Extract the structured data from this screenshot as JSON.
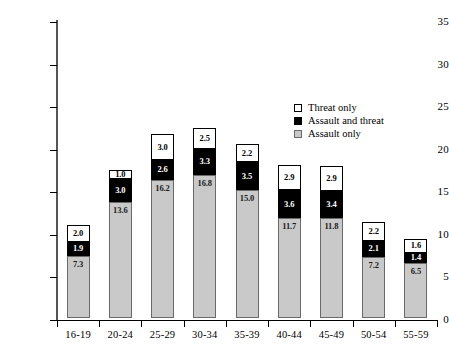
{
  "chart_data": {
    "type": "bar",
    "subtype": "stacked-bar",
    "title": "",
    "xlabel": "",
    "ylabel": "% of men",
    "ylim": [
      0,
      35
    ],
    "ytick_step": 5,
    "yticks": [
      "35",
      "30",
      "25",
      "20",
      "15",
      "10",
      "5",
      "0"
    ],
    "grid": false,
    "legend_position": "upper-right",
    "categories": [
      "16-19",
      "20-24",
      "25-29",
      "30-34",
      "35-39",
      "40-44",
      "45-49",
      "50-54",
      "55-59"
    ],
    "series": [
      {
        "name": "Assault only",
        "color": "#c9c9c9",
        "values": [
          7.3,
          13.6,
          16.2,
          16.8,
          15.0,
          11.7,
          11.8,
          7.2,
          6.5
        ],
        "labels": [
          "7.3",
          "13.6",
          "16.2",
          "16.8",
          "15.0",
          "11.7",
          "11.8",
          "7.2",
          "6.5"
        ]
      },
      {
        "name": "Assault and threat",
        "color": "#000000",
        "values": [
          1.9,
          3.0,
          2.6,
          3.3,
          3.5,
          3.6,
          3.4,
          2.1,
          1.4
        ],
        "labels": [
          "1.9",
          "3.0",
          "2.6",
          "3.3",
          "3.5",
          "3.6",
          "3.4",
          "2.1",
          "1.4"
        ]
      },
      {
        "name": "Threat only",
        "color": "#ffffff",
        "values": [
          2.0,
          1.0,
          3.0,
          2.5,
          2.2,
          2.9,
          2.9,
          2.2,
          1.6
        ],
        "labels": [
          "2.0",
          "1.0",
          "3.0",
          "2.5",
          "2.2",
          "2.9",
          "2.9",
          "2.2",
          "1.6"
        ]
      }
    ],
    "totals": [
      11.2,
      17.6,
      21.8,
      22.6,
      20.7,
      18.2,
      18.1,
      11.5,
      9.5
    ]
  },
  "legend": {
    "items": [
      {
        "label": "Threat only",
        "swatch": "white"
      },
      {
        "label": "Assault and threat",
        "swatch": "black"
      },
      {
        "label": "Assault only",
        "swatch": "gray"
      }
    ]
  }
}
